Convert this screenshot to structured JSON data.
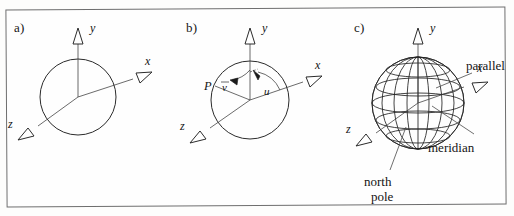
{
  "figure": {
    "border_color": "#6e6e6e",
    "background": "#fefefe",
    "stroke_color": "#2b2b2b"
  },
  "panels": [
    {
      "tag": "a)",
      "description": "sphere outline with xyz coordinate axes",
      "axes": [
        {
          "label": "y",
          "direction": "up"
        },
        {
          "label": "x",
          "direction": "upper-right"
        },
        {
          "label": "z",
          "direction": "lower-left"
        }
      ]
    },
    {
      "tag": "b)",
      "description": "sphere with point P and spherical angle parameters u and v",
      "axes": [
        {
          "label": "y",
          "direction": "up"
        },
        {
          "label": "x",
          "direction": "upper-right"
        },
        {
          "label": "z",
          "direction": "lower-left"
        }
      ],
      "point_label": "P",
      "angle_v": "v",
      "angle_u": "u"
    },
    {
      "tag": "c)",
      "description": "wireframe globe with graticule of parallels and meridians",
      "axes": [
        {
          "label": "y",
          "direction": "up"
        },
        {
          "label": "x",
          "direction": "upper-right"
        },
        {
          "label": "z",
          "direction": "lower-left"
        }
      ],
      "annotations": [
        {
          "name": "parallel",
          "text": "parallel"
        },
        {
          "name": "meridian",
          "text": "meridian"
        },
        {
          "name": "north-pole",
          "text_line1": "north",
          "text_line2": "pole"
        }
      ],
      "graticule": {
        "parallels": 5,
        "meridians": 6
      }
    }
  ]
}
